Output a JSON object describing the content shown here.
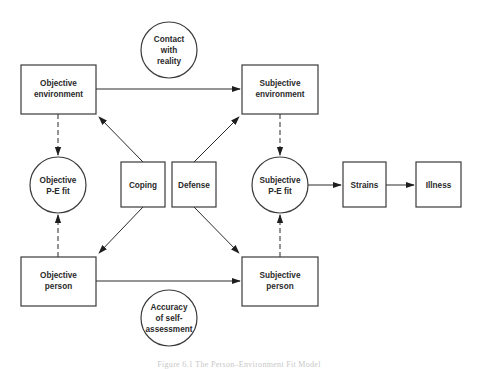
{
  "diagram": {
    "caption": "Figure 6.1 The Person–Environment Fit Model",
    "colors": {
      "stroke": "#3a3a3a",
      "text": "#2a2a2a",
      "background": "#ffffff",
      "caption": "#c8c8c8"
    },
    "nodes": {
      "objective_environment": {
        "shape": "box",
        "line1": "Objective",
        "line2": "environment"
      },
      "subjective_environment": {
        "shape": "box",
        "line1": "Subjective",
        "line2": "environment"
      },
      "contact_with_reality": {
        "shape": "circle",
        "line1": "Contact",
        "line2": "with",
        "line3": "reality"
      },
      "objective_pe_fit": {
        "shape": "circle",
        "line1": "Objective",
        "line2": "P-E fit"
      },
      "coping": {
        "shape": "box",
        "label": "Coping"
      },
      "defense": {
        "shape": "box",
        "label": "Defense"
      },
      "subjective_pe_fit": {
        "shape": "circle",
        "line1": "Subjective",
        "line2": "P-E fit"
      },
      "strains": {
        "shape": "box",
        "label": "Strains"
      },
      "illness": {
        "shape": "box",
        "label": "Illness"
      },
      "objective_person": {
        "shape": "box",
        "line1": "Objective",
        "line2": "person"
      },
      "subjective_person": {
        "shape": "box",
        "line1": "Subjective",
        "line2": "person"
      },
      "accuracy_of_self_assessment": {
        "shape": "circle",
        "line1": "Accuracy",
        "line2": "of self-",
        "line3": "assessment"
      }
    },
    "edges": [
      {
        "from": "Objective environment",
        "to": "Subjective environment",
        "style": "solid"
      },
      {
        "from": "Objective person",
        "to": "Subjective person",
        "style": "solid"
      },
      {
        "from": "Objective environment",
        "to": "Objective P-E fit",
        "style": "dashed"
      },
      {
        "from": "Objective person",
        "to": "Objective P-E fit",
        "style": "dashed"
      },
      {
        "from": "Subjective environment",
        "to": "Subjective P-E fit",
        "style": "dashed"
      },
      {
        "from": "Subjective person",
        "to": "Subjective P-E fit",
        "style": "dashed"
      },
      {
        "from": "Coping",
        "to": "Objective environment",
        "style": "solid"
      },
      {
        "from": "Coping",
        "to": "Objective person",
        "style": "solid"
      },
      {
        "from": "Defense",
        "to": "Subjective environment",
        "style": "solid"
      },
      {
        "from": "Defense",
        "to": "Subjective person",
        "style": "solid"
      },
      {
        "from": "Subjective P-E fit",
        "to": "Strains",
        "style": "solid"
      },
      {
        "from": "Strains",
        "to": "Illness",
        "style": "solid"
      }
    ]
  }
}
